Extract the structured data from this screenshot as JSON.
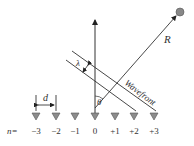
{
  "diagram": {
    "labels": {
      "range": "R",
      "wavelength": "λ",
      "wavefront": "Wavefront",
      "angle": "θ",
      "spacing": "d",
      "index_prefix": "n="
    },
    "elements": [
      {
        "n": "−3",
        "x": 36
      },
      {
        "n": "−2",
        "x": 56
      },
      {
        "n": "−1",
        "x": 75
      },
      {
        "n": "0",
        "x": 95
      },
      {
        "n": "+1",
        "x": 115
      },
      {
        "n": "+2",
        "x": 134
      },
      {
        "n": "+3",
        "x": 154
      }
    ],
    "colors": {
      "line": "#333333",
      "element": "#8c8c8c",
      "source": "#888888"
    }
  }
}
